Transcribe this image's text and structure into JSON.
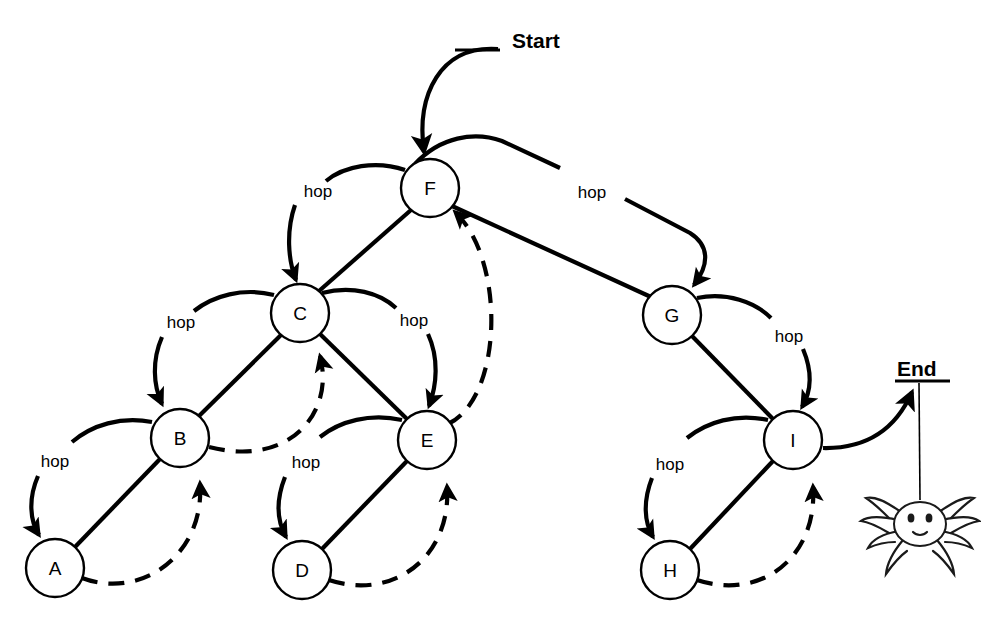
{
  "figure": {
    "background_color": "#ffffff",
    "stroke_color": "#000000"
  },
  "terminals": {
    "start_label": "Start",
    "end_label": "End"
  },
  "nodes": [
    {
      "id": "A",
      "label": "A",
      "cx": 55,
      "cy": 568,
      "r": 29
    },
    {
      "id": "B",
      "label": "B",
      "cx": 180,
      "cy": 438,
      "r": 29
    },
    {
      "id": "C",
      "label": "C",
      "cx": 300,
      "cy": 313,
      "r": 29
    },
    {
      "id": "D",
      "label": "D",
      "cx": 302,
      "cy": 570,
      "r": 29
    },
    {
      "id": "E",
      "label": "E",
      "cx": 427,
      "cy": 440,
      "r": 29
    },
    {
      "id": "F",
      "label": "F",
      "cx": 430,
      "cy": 188,
      "r": 29
    },
    {
      "id": "G",
      "label": "G",
      "cx": 672,
      "cy": 315,
      "r": 29
    },
    {
      "id": "H",
      "label": "H",
      "cx": 670,
      "cy": 570,
      "r": 29
    },
    {
      "id": "I",
      "label": "I",
      "cx": 793,
      "cy": 440,
      "r": 29
    }
  ],
  "tree_edges": [
    {
      "from": "F",
      "to": "C",
      "style": "solid"
    },
    {
      "from": "C",
      "to": "B",
      "style": "solid"
    },
    {
      "from": "B",
      "to": "A",
      "style": "solid"
    },
    {
      "from": "C",
      "to": "E",
      "style": "solid"
    },
    {
      "from": "E",
      "to": "D",
      "style": "solid"
    },
    {
      "from": "F",
      "to": "G",
      "style": "solid"
    },
    {
      "from": "G",
      "to": "I",
      "style": "solid"
    },
    {
      "from": "I",
      "to": "H",
      "style": "solid"
    }
  ],
  "back_edges": [
    {
      "from": "A",
      "to": "B",
      "style": "dashed"
    },
    {
      "from": "B",
      "to": "C",
      "style": "dashed"
    },
    {
      "from": "D",
      "to": "E",
      "style": "dashed"
    },
    {
      "from": "E",
      "to": "F",
      "style": "dashed"
    },
    {
      "from": "H",
      "to": "I",
      "style": "dashed"
    }
  ],
  "hop_arcs": [
    {
      "from": "F",
      "to": "C",
      "label": "hop",
      "label_x": 318,
      "label_y": 191
    },
    {
      "from": "C",
      "to": "B",
      "label": "hop",
      "label_x": 181,
      "label_y": 322
    },
    {
      "from": "B",
      "to": "A",
      "label": "hop",
      "label_x": 55,
      "label_y": 461
    },
    {
      "from": "C",
      "to": "E",
      "label": "hop",
      "label_x": 414,
      "label_y": 320
    },
    {
      "from": "E",
      "to": "D",
      "label": "hop",
      "label_x": 306,
      "label_y": 462
    },
    {
      "from": "F",
      "to": "G",
      "label": "hop",
      "label_x": 592,
      "label_y": 192
    },
    {
      "from": "G",
      "to": "I",
      "label": "hop",
      "label_x": 789,
      "label_y": 336
    },
    {
      "from": "I",
      "to": "H",
      "label": "hop",
      "label_x": 670,
      "label_y": 464
    }
  ],
  "hop_label_text": "hop",
  "spider": {
    "name": "spider",
    "thread_top_x": 916,
    "thread_top_y": 382,
    "body_cx": 920,
    "body_cy": 523
  },
  "start_arrow": {
    "target_node": "F",
    "label_x": 512,
    "label_y": 40
  },
  "end_arrow": {
    "source_node": "I",
    "label_x": 898,
    "label_y": 368
  }
}
